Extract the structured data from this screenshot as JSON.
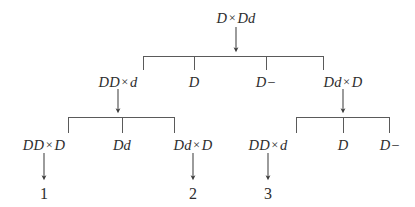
{
  "figure": {
    "kind": "breeding-cross-tree",
    "background_color": "#ffffff",
    "ink_color": "#2d2d2d",
    "width": 415,
    "height": 207
  },
  "levels": {
    "root_label": "Level 0 — parental cross",
    "level1_label": "Level 1 — offspring",
    "level2_label": "Level 2 — offspring",
    "outcome_label": "Numbered outcomes"
  },
  "nodes": {
    "root": {
      "left": "D",
      "op": "×",
      "right": "Dd",
      "text": "D × Dd",
      "x": 236,
      "y": 18
    },
    "row1": [
      {
        "left": "DD",
        "op": "×",
        "right": "d",
        "text": "DD × d",
        "x": 118,
        "y": 82
      },
      {
        "left": "D",
        "op": "",
        "right": "",
        "text": "D",
        "x": 194,
        "y": 82
      },
      {
        "left": "D−",
        "op": "",
        "right": "",
        "text": "D−",
        "x": 266,
        "y": 82
      },
      {
        "left": "Dd",
        "op": "×",
        "right": "D",
        "text": "Dd × D",
        "x": 343,
        "y": 82
      }
    ],
    "row2": [
      {
        "left": "DD",
        "op": "×",
        "right": "D",
        "text": "DD × D",
        "x": 44,
        "y": 145
      },
      {
        "left": "Dd",
        "op": "",
        "right": "",
        "text": "Dd",
        "x": 122,
        "y": 145
      },
      {
        "left": "Dd",
        "op": "×",
        "right": "D",
        "text": "Dd × D",
        "x": 193,
        "y": 145
      },
      {
        "left": "DD",
        "op": "×",
        "right": "d",
        "text": "DD × d",
        "x": 268,
        "y": 145
      },
      {
        "left": "D",
        "op": "",
        "right": "",
        "text": "D",
        "x": 343,
        "y": 145
      },
      {
        "left": "D−",
        "op": "",
        "right": "",
        "text": "D−",
        "x": 390,
        "y": 145
      }
    ]
  },
  "outcomes": [
    {
      "label": "1",
      "x": 44,
      "y": 194
    },
    {
      "label": "2",
      "x": 193,
      "y": 194
    },
    {
      "label": "3",
      "x": 268,
      "y": 194
    }
  ],
  "connectors": {
    "root_arrow": {
      "x": 236,
      "y_from": 26,
      "y_to": 52
    },
    "bar_root": {
      "y": 56,
      "x_left": 143,
      "x_right": 324,
      "drops": [
        143,
        194,
        266,
        324
      ],
      "drop_to": 70
    },
    "arrow_left_subtree": {
      "x": 118,
      "y_from": 88,
      "y_to": 113
    },
    "bar_left": {
      "y": 117,
      "x_left": 68,
      "x_right": 175,
      "drops": [
        68,
        122,
        175
      ],
      "drop_to": 133
    },
    "arrow_right_subtree": {
      "x": 343,
      "y_from": 88,
      "y_to": 113
    },
    "bar_right": {
      "y": 117,
      "x_left": 296,
      "x_right": 390,
      "drops": [
        296,
        343,
        390
      ],
      "drop_to": 133
    },
    "arrow_outcome_1": {
      "x": 44,
      "y_from": 152,
      "y_to": 180
    },
    "arrow_outcome_2": {
      "x": 193,
      "y_from": 152,
      "y_to": 180
    },
    "arrow_outcome_3": {
      "x": 268,
      "y_from": 152,
      "y_to": 180
    }
  }
}
